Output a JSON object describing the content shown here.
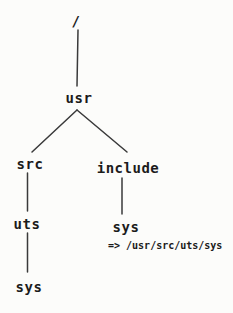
{
  "diagram": {
    "type": "tree",
    "description_colors": {
      "ink": "#1b1b1b",
      "line": "#3a3a3a",
      "background": "#fcfcfa"
    },
    "nodes": [
      {
        "id": "root",
        "label": "/",
        "parent": null
      },
      {
        "id": "usr",
        "label": "usr",
        "parent": "root"
      },
      {
        "id": "src",
        "label": "src",
        "parent": "usr"
      },
      {
        "id": "include",
        "label": "include",
        "parent": "usr"
      },
      {
        "id": "uts",
        "label": "uts",
        "parent": "src"
      },
      {
        "id": "sys-include",
        "label": "sys",
        "parent": "include"
      },
      {
        "id": "sys-uts",
        "label": "sys",
        "parent": "uts"
      }
    ],
    "annotation": {
      "arrow": "=>",
      "path": "/usr/src/uts/sys"
    }
  }
}
